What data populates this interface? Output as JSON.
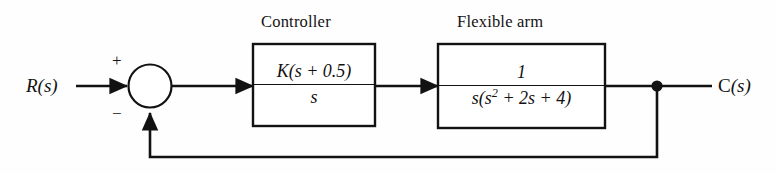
{
  "diagram": {
    "type": "control-system-block-diagram",
    "input_signal": {
      "label_upright": "R",
      "label_italic": "(s)"
    },
    "output_signal": {
      "label_upright": "C",
      "label_italic": "(s)"
    },
    "summing_junction": {
      "name": "summing-junction",
      "input_sign": "+",
      "feedback_sign": "−"
    },
    "blocks": [
      {
        "id": "controller",
        "caption": "Controller",
        "numerator": "K(s + 0.5)",
        "denominator": "s",
        "numerator_parts": {
          "gain": "K",
          "zero": "0.5"
        },
        "transfer_function": "K(s + 0.5)/s"
      },
      {
        "id": "flexible-arm",
        "caption": "Flexible arm",
        "numerator": "1",
        "denominator_prefix": "s(s",
        "denominator_exponent": "2",
        "denominator_suffix": " + 2s + 4)",
        "transfer_function": "1/(s(s^2 + 2s + 4))"
      }
    ],
    "feedback": {
      "name": "unity-feedback-path",
      "gain": "1",
      "description": "unity negative feedback"
    },
    "colors": {
      "line": "#121212",
      "text": "#121212",
      "background": "#fefefe"
    }
  }
}
